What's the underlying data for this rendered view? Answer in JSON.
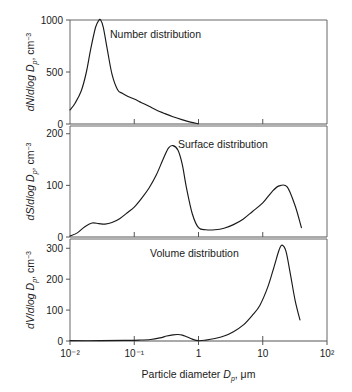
{
  "figure": {
    "xaxis": {
      "label_prefix": "Particle diameter ",
      "label_var": "D",
      "label_sub": "p",
      "label_suffix": ", μm",
      "tick_labels": [
        "10⁻²",
        "10⁻¹",
        "1",
        "10",
        "10²"
      ],
      "tick_values": [
        0.01,
        0.1,
        1,
        10,
        100
      ],
      "scale": "log"
    },
    "panels": [
      {
        "id": "number",
        "annotation": "Number distribution",
        "ylabel_num": "dN",
        "ylabel_den": "dlog D",
        "ylabel_sub": "p",
        "ylabel_unit": ", cm",
        "ylabel_exp": "−3",
        "yticks": [
          0,
          500,
          1000
        ],
        "ytick_labels": [
          "0",
          "500",
          "1000"
        ],
        "ylim": [
          0,
          1000
        ]
      },
      {
        "id": "surface",
        "annotation": "Surface distribution",
        "ylabel_num": "dS",
        "ylabel_den": "dlog D",
        "ylabel_sub": "p",
        "ylabel_unit": ", cm",
        "ylabel_exp": "−3",
        "yticks": [
          0,
          100,
          200
        ],
        "ytick_labels": [
          "0",
          "100",
          "200"
        ],
        "ylim": [
          0,
          215
        ]
      },
      {
        "id": "volume",
        "annotation": "Volume distribution",
        "ylabel_num": "dV",
        "ylabel_den": "dlog D",
        "ylabel_sub": "p",
        "ylabel_unit": ", cm",
        "ylabel_exp": "−3",
        "yticks": [
          0,
          100,
          200,
          300
        ],
        "ytick_labels": [
          "0",
          "100",
          "200",
          "300"
        ],
        "ylim": [
          0,
          330
        ]
      }
    ]
  },
  "chart_data": [
    {
      "type": "line",
      "id": "number",
      "title": "Number distribution",
      "xlabel": "Particle diameter Dp, μm",
      "ylabel": "dN/dlog Dp, cm-3",
      "xscale": "log",
      "xlim": [
        0.01,
        100
      ],
      "ylim": [
        0,
        1000
      ],
      "grid": false,
      "x": [
        0.01,
        0.012,
        0.015,
        0.018,
        0.021,
        0.025,
        0.028,
        0.03,
        0.033,
        0.038,
        0.045,
        0.055,
        0.065,
        0.08,
        0.1,
        0.13,
        0.17,
        0.22,
        0.3,
        0.4,
        0.55,
        0.75,
        1.0
      ],
      "values": [
        135,
        200,
        320,
        500,
        720,
        930,
        995,
        1000,
        930,
        720,
        480,
        330,
        295,
        265,
        240,
        205,
        170,
        135,
        100,
        70,
        42,
        18,
        2
      ]
    },
    {
      "type": "line",
      "id": "surface",
      "title": "Surface distribution",
      "xlabel": "Particle diameter Dp, μm",
      "ylabel": "dS/dlog Dp, cm-3",
      "xscale": "log",
      "xlim": [
        0.01,
        100
      ],
      "ylim": [
        0,
        215
      ],
      "grid": false,
      "x": [
        0.01,
        0.013,
        0.017,
        0.022,
        0.028,
        0.035,
        0.045,
        0.06,
        0.08,
        0.1,
        0.13,
        0.17,
        0.22,
        0.28,
        0.34,
        0.4,
        0.48,
        0.56,
        0.65,
        0.8,
        1.0,
        1.3,
        1.8,
        2.5,
        3.5,
        5.0,
        7.0,
        10.0,
        14.0,
        18.0,
        24.0,
        32.0,
        40.0
      ],
      "values": [
        2,
        8,
        20,
        27,
        26,
        25,
        28,
        36,
        48,
        58,
        75,
        95,
        120,
        150,
        172,
        177,
        168,
        140,
        95,
        45,
        18,
        14,
        14,
        17,
        24,
        35,
        50,
        66,
        88,
        99,
        97,
        60,
        18
      ]
    },
    {
      "type": "line",
      "id": "volume",
      "title": "Volume distribution",
      "xlabel": "Particle diameter Dp, μm",
      "ylabel": "dV/dlog Dp, cm-3",
      "xscale": "log",
      "xlim": [
        0.01,
        100
      ],
      "ylim": [
        0,
        330
      ],
      "grid": false,
      "x": [
        0.01,
        0.03,
        0.07,
        0.12,
        0.18,
        0.25,
        0.32,
        0.4,
        0.48,
        0.56,
        0.65,
        0.8,
        1.0,
        1.3,
        1.8,
        2.5,
        3.5,
        5.0,
        7.0,
        9.0,
        12.0,
        15.0,
        18.0,
        20.0,
        23.0,
        27.0,
        32.0,
        38.0
      ],
      "values": [
        1,
        1,
        2,
        3,
        5,
        10,
        16,
        20,
        21,
        19,
        14,
        6,
        1,
        3,
        8,
        16,
        30,
        52,
        85,
        115,
        175,
        240,
        295,
        310,
        290,
        215,
        130,
        68
      ]
    }
  ]
}
